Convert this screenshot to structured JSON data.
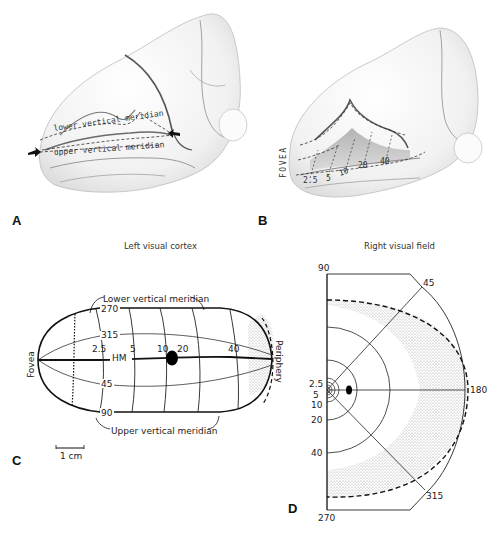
{
  "figure": {
    "panels": {
      "A": {
        "label": "A",
        "annotations": [
          "lower vertical meridian",
          "upper vertical meridian"
        ]
      },
      "B": {
        "label": "B",
        "fovea_label": "FOVEA",
        "eccentricity_labels": [
          "2.5",
          "5",
          "10",
          "20",
          "40"
        ]
      },
      "C": {
        "label": "C",
        "title": "Left visual cortex",
        "lower_meridian_label": "Lower vertical meridian",
        "upper_meridian_label": "Upper vertical meridian",
        "fovea_label": "Fovea",
        "periphery_label": "Periphery",
        "hm_label": "HM",
        "angle_labels": {
          "a270": "270",
          "a315": "315",
          "a45": "45",
          "a90": "90"
        },
        "eccentricity_labels": [
          "2.5",
          "5",
          "10",
          "20",
          "40"
        ],
        "scale_bar_label": "1 cm"
      },
      "D": {
        "label": "D",
        "title": "Right visual field",
        "angle_labels": {
          "a90": "90",
          "a45": "45",
          "a180": "180",
          "a315": "315",
          "a270": "270"
        },
        "eccentricity_labels": [
          "2.5",
          "5",
          "10",
          "20",
          "40"
        ]
      }
    }
  }
}
